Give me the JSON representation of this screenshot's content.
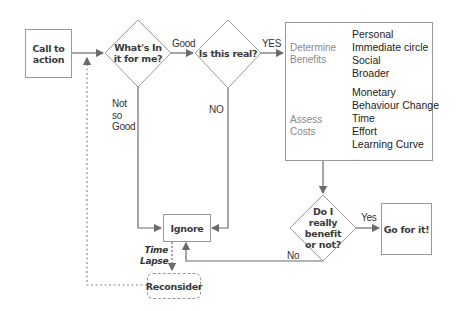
{
  "diagram": {
    "type": "flowchart",
    "nodes": {
      "call_to_action": "Call to action",
      "whats_in_it": "What's In it for me?",
      "is_this_real": "Is this real?",
      "determine_benefits": "Determine Benefits",
      "assess_costs": "Assess Costs",
      "benefits_list": [
        "Personal",
        "Immediate circle",
        "Social",
        "Broader"
      ],
      "costs_list": [
        "Monetary",
        "Behaviour Change",
        "Time",
        "Effort",
        "Learning Curve",
        "..."
      ],
      "do_i_benefit": "Do I really benefit or not?",
      "go_for_it": "Go for it!",
      "ignore": "Ignore",
      "reconsider": "Reconsider"
    },
    "edges": {
      "good": "Good",
      "yes_upper": "YES",
      "not_so_good": "Not so Good",
      "no_upper": "NO",
      "yes": "Yes",
      "no": "No",
      "time_lapse": "Time Lapse"
    },
    "colors": {
      "line": "#6b6b6b",
      "box_border": "#9a9a9a",
      "dashed": "#8a8a8a",
      "text": "#333333",
      "muted_text": "#8a8a8a"
    }
  }
}
